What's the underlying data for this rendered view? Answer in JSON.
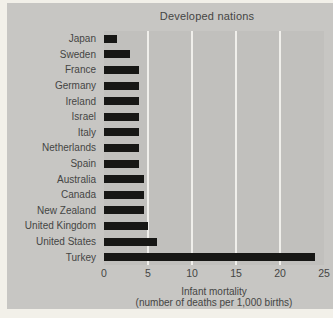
{
  "figure": {
    "title": "Developed nations",
    "xlabel_line1": "Infant mortality",
    "xlabel_line2": "(number of deaths per 1,000 births)"
  },
  "chart_data": {
    "type": "bar",
    "orientation": "horizontal",
    "title": "Developed nations",
    "categories": [
      "Japan",
      "Sweden",
      "France",
      "Germany",
      "Ireland",
      "Israel",
      "Italy",
      "Netherlands",
      "Spain",
      "Australia",
      "Canada",
      "New Zealand",
      "United Kingdom",
      "United States",
      "Turkey"
    ],
    "values": [
      1.5,
      3,
      4,
      4,
      4,
      4,
      4,
      4,
      4,
      4.5,
      4.5,
      4.5,
      5,
      6,
      24
    ],
    "xlabel": "Infant mortality",
    "xlabel_sub": "(number of deaths per 1,000 births)",
    "xlim": [
      0,
      25
    ],
    "xticks": [
      0,
      5,
      10,
      15,
      20,
      25
    ],
    "grid": true,
    "legend": false
  },
  "colors": {
    "page_bg": "#f2f0e9",
    "panel_bg": "#c7c6c3",
    "plot_bg": "#c1c0bd",
    "gridline": "#f0efeb",
    "bar": "#171715",
    "text": "#454543"
  }
}
